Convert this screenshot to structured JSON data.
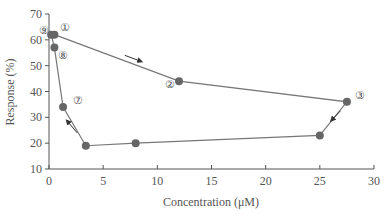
{
  "chart_data": {
    "type": "line",
    "title": "",
    "xlabel": "Concentration (μM)",
    "ylabel": "Response (%)",
    "xlim": [
      0,
      30
    ],
    "ylim": [
      10,
      70
    ],
    "xticks": [
      0,
      5,
      10,
      15,
      20,
      25,
      30
    ],
    "yticks": [
      10,
      20,
      30,
      40,
      50,
      60,
      70
    ],
    "grid": false,
    "legend": null,
    "series": [
      {
        "name": "trajectory",
        "x": [
          0.5,
          12.0,
          27.5,
          25.0,
          8.0,
          3.4,
          1.3,
          0.5,
          0.2
        ],
        "y": [
          62,
          44,
          36,
          23,
          20,
          19,
          34,
          57,
          62
        ]
      }
    ],
    "annotations": [
      {
        "text": "①",
        "x": 1.5,
        "y": 63.5
      },
      {
        "text": "②",
        "x": 11.2,
        "y": 41.5
      },
      {
        "text": "③",
        "x": 28.7,
        "y": 37
      },
      {
        "text": "⑦",
        "x": 2.7,
        "y": 35
      },
      {
        "text": "⑧",
        "x": 1.3,
        "y": 52.5
      },
      {
        "text": "⑨",
        "x": -0.5,
        "y": 62.3
      }
    ],
    "arrows": [
      {
        "from": [
          7,
          54
        ],
        "to": [
          8.6,
          51.5
        ]
      },
      {
        "from": [
          26.9,
          32.5
        ],
        "to": [
          26.0,
          28.5
        ]
      },
      {
        "from": [
          2.6,
          24
        ],
        "to": [
          1.6,
          29
        ]
      }
    ],
    "colors": {
      "line": "#777777",
      "marker": "#666666",
      "axis": "#555555",
      "text": "#555555"
    }
  }
}
